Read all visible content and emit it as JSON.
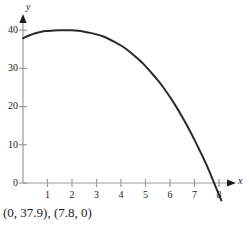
{
  "caption": "(0, 37.9), (7.8, 0)",
  "axes": {
    "x_name": "x",
    "y_name": "y",
    "x_ticks": [
      "1",
      "2",
      "3",
      "4",
      "5",
      "6",
      "7",
      "8"
    ],
    "y_ticks": [
      "0",
      "10",
      "20",
      "30",
      "40"
    ]
  },
  "colors": {
    "curve": "#2b2b2b",
    "axis": "#9a9a9a",
    "text": "#1c1c1c",
    "background": "#ffffff"
  },
  "chart_data": {
    "type": "line",
    "title": "",
    "xlabel": "x",
    "ylabel": "y",
    "xlim": [
      0,
      8.35
    ],
    "ylim": [
      -2.2,
      42
    ],
    "grid": false,
    "legend": null,
    "xticks": [
      1,
      2,
      3,
      4,
      5,
      6,
      7,
      8
    ],
    "yticks": [
      0,
      10,
      20,
      30,
      40
    ],
    "annotations": [
      "(0, 37.9)",
      "(7.8, 0)"
    ],
    "intercepts": {
      "y_intercept": 37.9,
      "x_intercept": 7.8
    },
    "vertex": {
      "x": 2.0,
      "y": 40.0
    },
    "series": [
      {
        "name": "curve",
        "x": [
          0,
          0.25,
          0.5,
          0.75,
          1,
          1.25,
          1.5,
          1.75,
          2,
          2.25,
          2.5,
          2.75,
          3,
          3.25,
          3.5,
          3.75,
          4,
          4.25,
          4.5,
          4.75,
          5,
          5.25,
          5.5,
          5.75,
          6,
          6.25,
          6.5,
          6.75,
          7,
          7.25,
          7.5,
          7.75,
          7.8,
          8,
          8.1
        ],
        "y": [
          37.9,
          38.6,
          39.2,
          39.6,
          39.8,
          39.95,
          40.0,
          40.0,
          40.0,
          39.85,
          39.6,
          39.3,
          38.9,
          38.4,
          37.7,
          36.9,
          36.0,
          34.9,
          33.6,
          32.2,
          30.6,
          28.8,
          26.9,
          24.8,
          22.5,
          20.0,
          17.3,
          14.4,
          11.3,
          8.0,
          4.6,
          0.8,
          0.0,
          -3.1,
          -4.6
        ]
      }
    ]
  }
}
